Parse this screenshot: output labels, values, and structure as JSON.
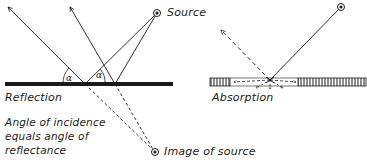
{
  "reflection_diagram": {
    "source_label": "Source",
    "surface_label": "Reflection",
    "angle_symbol_left": "α",
    "angle_symbol_right": "α",
    "caption_lines": [
      "Angle of incidence",
      "equals angle of",
      "reflectance"
    ],
    "image_label": "Image of source"
  },
  "absorption_diagram": {
    "surface_label": "Absorption"
  },
  "colors": {
    "ink": "#1a1a1a",
    "background": "#ffffff"
  }
}
